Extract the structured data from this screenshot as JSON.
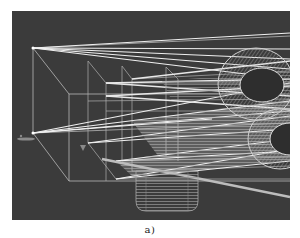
{
  "figure": {
    "caption": "a)",
    "colors": {
      "background": "#3b3b3b",
      "wire": "#bdbdbd",
      "ray": "#f2f2f2",
      "hatch": "#9a9a9a",
      "page": "#ffffff"
    },
    "sources": [
      {
        "name": "upper-source",
        "x": 21,
        "y": 37
      },
      {
        "name": "lower-source",
        "x": 21,
        "y": 122
      }
    ]
  }
}
